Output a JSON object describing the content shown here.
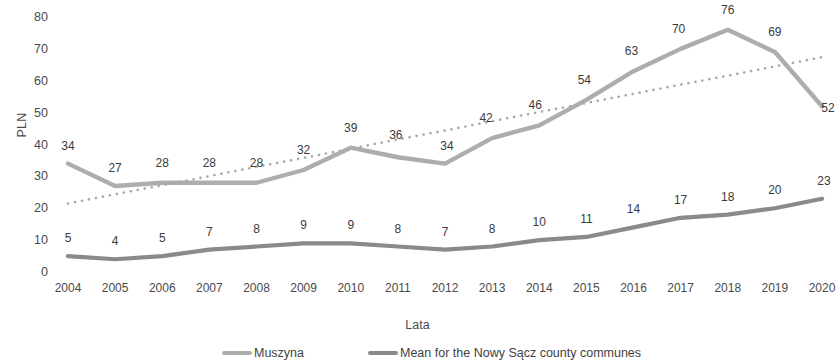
{
  "chart_data": {
    "type": "line",
    "title": "",
    "subtitle": "",
    "xlabel": "Lata",
    "ylabel": "PLN",
    "categories": [
      "2004",
      "2005",
      "2006",
      "2007",
      "2008",
      "2009",
      "2010",
      "2011",
      "2012",
      "2013",
      "2014",
      "2015",
      "2016",
      "2017",
      "2018",
      "2019",
      "2020"
    ],
    "ylim": [
      0,
      80
    ],
    "yticks": [
      0,
      10,
      20,
      30,
      40,
      50,
      60,
      70,
      80
    ],
    "ytick_labels": [
      "0",
      "10",
      "20",
      "30",
      "40",
      "50",
      "60",
      "70",
      "80"
    ],
    "grid": false,
    "legend_position": "bottom",
    "series": [
      {
        "name": "Muszyna",
        "color": "#adadad",
        "style": "solid",
        "show_labels": true,
        "values": [
          34,
          27,
          28,
          28,
          28,
          32,
          39,
          36,
          34,
          42,
          46,
          54,
          63,
          70,
          76,
          69,
          52
        ],
        "labels": [
          "34",
          "27",
          "28",
          "28",
          "28",
          "32",
          "39",
          "36",
          "34",
          "42",
          "46",
          "54",
          "63",
          "70",
          "76",
          "69",
          "52"
        ]
      },
      {
        "name": "Mean for the Nowy Sącz county communes",
        "color": "#8a8a8a",
        "style": "solid",
        "show_labels": true,
        "values": [
          5,
          4,
          5,
          7,
          8,
          9,
          9,
          8,
          7,
          8,
          10,
          11,
          14,
          17,
          18,
          20,
          23
        ],
        "labels": [
          "5",
          "4",
          "5",
          "7",
          "8",
          "9",
          "9",
          "8",
          "7",
          "8",
          "10",
          "11",
          "14",
          "17",
          "18",
          "20",
          "23"
        ]
      },
      {
        "name": "Linear trend (Muszyna)",
        "color": "#a8a8a8",
        "style": "dotted",
        "show_labels": false,
        "values": [
          21.5,
          24.4,
          27.2,
          30.1,
          33.0,
          35.8,
          38.7,
          41.6,
          44.4,
          47.3,
          50.2,
          53.0,
          55.9,
          58.8,
          61.6,
          64.5,
          67.4
        ],
        "labels": []
      }
    ]
  },
  "legend": {
    "items": [
      {
        "label": "Muszyna",
        "color": "#adadad"
      },
      {
        "label": "Mean for the Nowy Sącz county communes",
        "color": "#8a8a8a"
      }
    ]
  }
}
